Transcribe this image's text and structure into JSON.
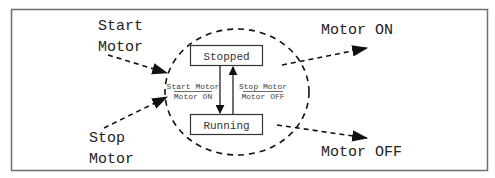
{
  "diagram": {
    "type": "state-machine",
    "colors": {
      "frame": "#6e6e6e",
      "ink": "#111111",
      "label": "#444444",
      "background": "#ffffff"
    },
    "inputs": [
      {
        "id": "start-motor",
        "line1": "Start",
        "line2": "Motor"
      },
      {
        "id": "stop-motor",
        "line1": "Stop",
        "line2": "Motor"
      }
    ],
    "outputs": [
      {
        "id": "motor-on",
        "label": "Motor ON"
      },
      {
        "id": "motor-off",
        "label": "Motor OFF"
      }
    ],
    "states": [
      {
        "id": "stopped",
        "label": "Stopped"
      },
      {
        "id": "running",
        "label": "Running"
      }
    ],
    "transitions": [
      {
        "from": "stopped",
        "to": "running",
        "event": "Start Motor",
        "action": "Motor ON"
      },
      {
        "from": "running",
        "to": "stopped",
        "event": "Stop Motor",
        "action": "Motor OFF"
      }
    ]
  }
}
